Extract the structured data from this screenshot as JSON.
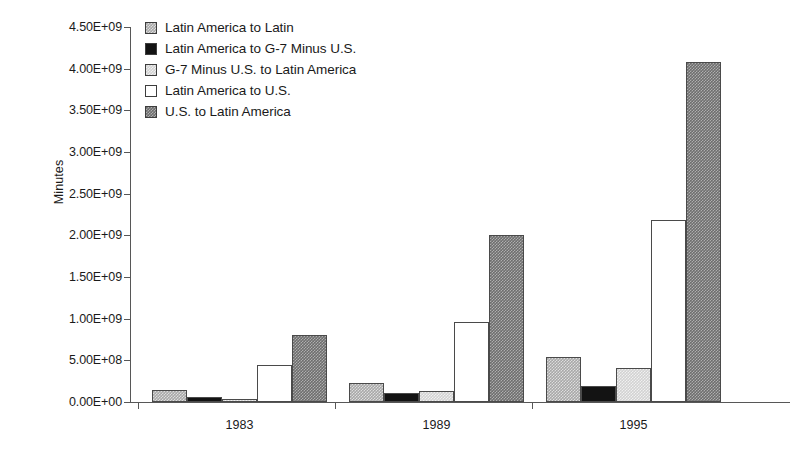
{
  "chart_data": {
    "type": "bar",
    "title": "",
    "xlabel": "",
    "ylabel": "Minutes",
    "categories": [
      "1983",
      "1989",
      "1995"
    ],
    "ylim": [
      0,
      4500000000
    ],
    "ytick_values": [
      0,
      500000000,
      1000000000,
      1500000000,
      2000000000,
      2500000000,
      3000000000,
      3500000000,
      4000000000,
      4500000000
    ],
    "ytick_labels": [
      "0.00E+00",
      "5.00E+08",
      "1.00E+09",
      "1.50E+09",
      "2.00E+09",
      "2.50E+09",
      "3.00E+09",
      "3.50E+09",
      "4.00E+09",
      "4.50E+09"
    ],
    "grid": false,
    "legend_position": "top-left",
    "series": [
      {
        "name": "Latin America to Latin",
        "swatch": "medium-gray-dither",
        "color": "#a8a8a8",
        "values": [
          140000000,
          230000000,
          540000000
        ]
      },
      {
        "name": "Latin America to G-7 Minus U.S.",
        "swatch": "solid-black",
        "color": "#131313",
        "values": [
          60000000,
          110000000,
          190000000
        ]
      },
      {
        "name": "G-7 Minus U.S. to Latin America",
        "swatch": "light-gray-dither",
        "color": "#d2d2d2",
        "values": [
          40000000,
          130000000,
          410000000
        ]
      },
      {
        "name": "Latin America to U.S.",
        "swatch": "white",
        "color": "#ffffff",
        "values": [
          450000000,
          960000000,
          2180000000
        ]
      },
      {
        "name": "U.S. to Latin America",
        "swatch": "dark-gray-dither",
        "color": "#6e6e6e",
        "values": [
          800000000,
          2010000000,
          4080000000
        ]
      }
    ]
  }
}
